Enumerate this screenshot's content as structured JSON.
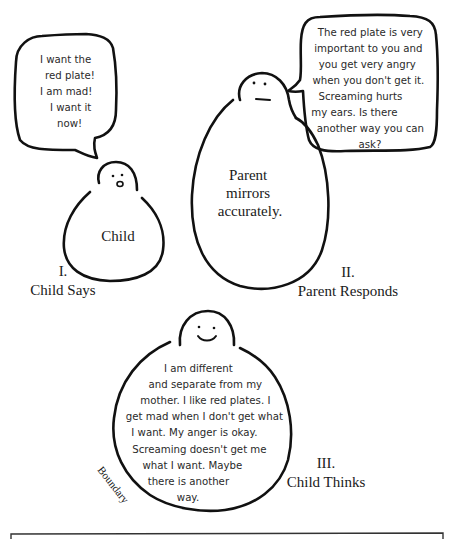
{
  "panels": [
    {
      "numeral": "I.",
      "caption": "Child Says",
      "figure_label": "Child",
      "speech": [
        "I want the",
        "red plate!",
        "I am mad!",
        "I want it",
        "now!"
      ]
    },
    {
      "numeral": "II.",
      "caption": "Parent Responds",
      "figure_label": [
        "Parent",
        "mirrors",
        "accurately."
      ],
      "speech": [
        "The red plate is very",
        "important to you and",
        "you get very angry",
        "when you don't get it.",
        "Screaming hurts",
        "my ears.  Is there",
        "another way you can",
        "ask?"
      ]
    },
    {
      "numeral": "III.",
      "caption": "Child Thinks",
      "boundary_label": "Boundary",
      "thought": [
        "I am different",
        "and separate from my",
        "mother.  I like red plates.  I",
        "get mad when I don't get what",
        "I want.  My anger is okay.",
        "Screaming doesn't get me",
        "what I want.  Maybe",
        "there is another",
        "way."
      ]
    }
  ]
}
